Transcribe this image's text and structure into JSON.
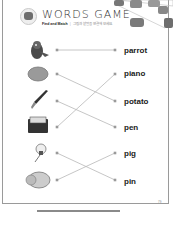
{
  "header": {
    "title": "WORDS GAME",
    "subtitle_bold": "Find and Match",
    "subtitle_sep": "|",
    "subtitle_desc": "그림과 낱말을 연결해 보세요."
  },
  "pictures": [
    {
      "id": "parrot",
      "icon": "parrot-icon"
    },
    {
      "id": "potato",
      "icon": "potato-icon"
    },
    {
      "id": "pen",
      "icon": "pen-icon"
    },
    {
      "id": "piano",
      "icon": "piano-icon"
    },
    {
      "id": "pin",
      "icon": "pin-icon"
    },
    {
      "id": "pig",
      "icon": "pig-icon"
    }
  ],
  "words": [
    "parrot",
    "piano",
    "potato",
    "pen",
    "pig",
    "pin"
  ],
  "matches": [
    {
      "picture_row": 0,
      "word_row": 0
    },
    {
      "picture_row": 1,
      "word_row": 2
    },
    {
      "picture_row": 2,
      "word_row": 3
    },
    {
      "picture_row": 3,
      "word_row": 1
    },
    {
      "picture_row": 4,
      "word_row": 5
    },
    {
      "picture_row": 5,
      "word_row": 4
    }
  ],
  "page_number": "79",
  "colors": {
    "line": "#b8b8b8",
    "dot": "#9a9a9a",
    "text": "#1a1a1a"
  }
}
